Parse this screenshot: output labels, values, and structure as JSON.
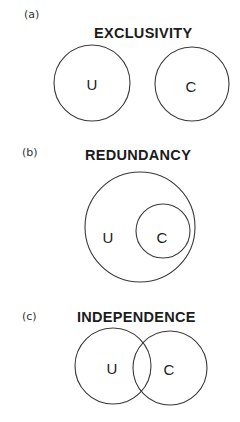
{
  "panels": [
    {
      "label": "(a)",
      "title": "EXCLUSIVITY",
      "sets": [
        {
          "name": "U",
          "cx": 92,
          "cy": 83,
          "r": 38
        },
        {
          "name": "C",
          "cx": 192,
          "cy": 84,
          "r": 37
        }
      ]
    },
    {
      "label": "(b)",
      "title": "REDUNDANCY",
      "sets": [
        {
          "name": "U",
          "cx": 140,
          "cy": 227,
          "r": 55,
          "label_x": 108,
          "label_y": 237
        },
        {
          "name": "C",
          "cx": 163,
          "cy": 231,
          "r": 27,
          "label_x": 163,
          "label_y": 237
        }
      ]
    },
    {
      "label": "(c)",
      "title": "INDEPENDENCE",
      "sets": [
        {
          "name": "U",
          "cx": 113,
          "cy": 366,
          "r": 38,
          "label_x": 112,
          "label_y": 368
        },
        {
          "name": "C",
          "cx": 170,
          "cy": 368,
          "r": 37,
          "label_x": 169,
          "label_y": 369
        }
      ]
    }
  ],
  "colors": {
    "stroke": "#3a3a3a",
    "text": "#1c1c1c",
    "background": "#ffffff"
  }
}
